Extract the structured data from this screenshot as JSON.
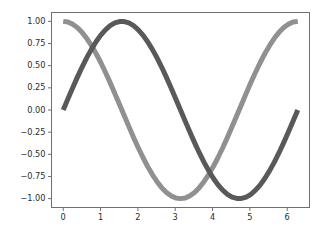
{
  "figure": {
    "background_color": "#ffffff",
    "axes_background_color": "#ffffff",
    "spine_color": "#6f6f6f",
    "tick_label_color": "#2b2b2b"
  },
  "chart_data": {
    "type": "line",
    "title": "",
    "xlabel": "",
    "ylabel": "",
    "grid": false,
    "legend": false,
    "xlim": [
      -0.314,
      6.597
    ],
    "ylim": [
      -1.1,
      1.1
    ],
    "xticks": [
      0,
      1,
      2,
      3,
      4,
      5,
      6
    ],
    "xtick_labels": [
      "0",
      "1",
      "2",
      "3",
      "4",
      "5",
      "6"
    ],
    "yticks": [
      1.0,
      0.75,
      0.5,
      0.25,
      0.0,
      -0.25,
      -0.5,
      -0.75,
      -1.0
    ],
    "ytick_labels": [
      "1.00",
      "0.75",
      "0.50",
      "0.25",
      "0.00",
      "−0.25",
      "−0.50",
      "−0.75",
      "−1.00"
    ],
    "x": [
      0.0,
      0.1257,
      0.2513,
      0.377,
      0.5027,
      0.6283,
      0.754,
      0.8796,
      1.0053,
      1.131,
      1.2566,
      1.3823,
      1.508,
      1.6336,
      1.7593,
      1.885,
      2.0106,
      2.1363,
      2.2619,
      2.3876,
      2.5133,
      2.6389,
      2.7646,
      2.8903,
      3.0159,
      3.1416,
      3.2673,
      3.3929,
      3.5186,
      3.6442,
      3.7699,
      3.8956,
      4.0212,
      4.1469,
      4.2726,
      4.3982,
      4.5239,
      4.6496,
      4.7752,
      4.9009,
      5.0265,
      5.1522,
      5.2779,
      5.4035,
      5.5292,
      5.6549,
      5.7805,
      5.9062,
      6.0319,
      6.1575,
      6.2832
    ],
    "series": [
      {
        "name": "cosine",
        "color": "#909090",
        "linewidth": 5.0,
        "values": [
          1.0,
          0.9921,
          0.9686,
          0.9298,
          0.8763,
          0.809,
          0.7289,
          0.6374,
          0.5358,
          0.4258,
          0.309,
          0.1874,
          0.0628,
          -0.0628,
          -0.1874,
          -0.309,
          -0.4258,
          -0.5358,
          -0.6374,
          -0.7289,
          -0.809,
          -0.8763,
          -0.9298,
          -0.9686,
          -0.9921,
          -1.0,
          -0.9921,
          -0.9686,
          -0.9298,
          -0.8763,
          -0.809,
          -0.7289,
          -0.6374,
          -0.5358,
          -0.4258,
          -0.309,
          -0.1874,
          -0.0628,
          0.0628,
          0.1874,
          0.309,
          0.4258,
          0.5358,
          0.6374,
          0.7289,
          0.809,
          0.8763,
          0.9298,
          0.9686,
          0.9921,
          1.0
        ]
      },
      {
        "name": "sine",
        "color": "#595959",
        "linewidth": 5.0,
        "values": [
          0.0,
          0.1253,
          0.2487,
          0.3681,
          0.4818,
          0.5878,
          0.6845,
          0.7705,
          0.8443,
          0.9048,
          0.9511,
          0.9823,
          0.998,
          0.998,
          0.9823,
          0.9511,
          0.9048,
          0.8443,
          0.7705,
          0.6845,
          0.5878,
          0.4818,
          0.3681,
          0.2487,
          0.1253,
          0.0,
          -0.1253,
          -0.2487,
          -0.3681,
          -0.4818,
          -0.5878,
          -0.6845,
          -0.7705,
          -0.8443,
          -0.9048,
          -0.9511,
          -0.9823,
          -0.998,
          -0.998,
          -0.9823,
          -0.9511,
          -0.9048,
          -0.8443,
          -0.7705,
          -0.6845,
          -0.5878,
          -0.4818,
          -0.3681,
          -0.2487,
          -0.1253,
          0.0
        ]
      }
    ]
  }
}
